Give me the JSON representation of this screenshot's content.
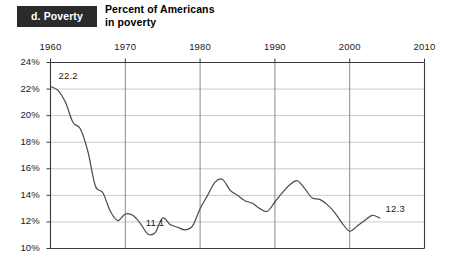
{
  "panel": {
    "tag_label": "d. Poverty"
  },
  "title": {
    "line1": "Percent of Americans",
    "line2": "in poverty"
  },
  "chart_data": {
    "type": "line",
    "title": "Percent of Americans in poverty",
    "xlabel": "",
    "ylabel": "",
    "xlim": [
      1960,
      2010
    ],
    "ylim": [
      10,
      24
    ],
    "xticks": [
      "1960",
      "1970",
      "1980",
      "1990",
      "2000",
      "2010"
    ],
    "xtick_values": [
      1960,
      1970,
      1980,
      1990,
      2000,
      2010
    ],
    "yticks": [
      "10%",
      "12%",
      "14%",
      "16%",
      "18%",
      "20%",
      "22%",
      "24%"
    ],
    "ytick_values": [
      10,
      12,
      14,
      16,
      18,
      20,
      22,
      24
    ],
    "grid": "both",
    "legend": "none",
    "series": [
      {
        "name": "Percent of Americans in poverty",
        "color": "#4a4a4a",
        "x": [
          1960,
          1961,
          1962,
          1963,
          1964,
          1965,
          1966,
          1967,
          1968,
          1969,
          1970,
          1971,
          1972,
          1973,
          1974,
          1975,
          1976,
          1977,
          1978,
          1979,
          1980,
          1981,
          1982,
          1983,
          1984,
          1985,
          1986,
          1987,
          1988,
          1989,
          1990,
          1991,
          1992,
          1993,
          1994,
          1995,
          1996,
          1997,
          1998,
          1999,
          2000,
          2001,
          2002,
          2003,
          2004
        ],
        "values": [
          22.2,
          21.9,
          21.0,
          19.5,
          19.0,
          17.3,
          14.7,
          14.2,
          12.8,
          12.1,
          12.6,
          12.5,
          11.9,
          11.1,
          11.2,
          12.3,
          11.8,
          11.6,
          11.4,
          11.7,
          13.0,
          14.0,
          15.0,
          15.2,
          14.4,
          14.0,
          13.6,
          13.4,
          13.0,
          12.8,
          13.5,
          14.2,
          14.8,
          15.1,
          14.5,
          13.8,
          13.7,
          13.3,
          12.7,
          11.9,
          11.3,
          11.7,
          12.1,
          12.5,
          12.3
        ]
      }
    ],
    "annotations": [
      {
        "label": "22.2",
        "x": 1960,
        "y": 22.2
      },
      {
        "label": "11.1",
        "x": 1973,
        "y": 11.1
      },
      {
        "label": "12.3",
        "x": 2004,
        "y": 12.3
      }
    ]
  },
  "colors": {
    "tag_background": "#2b2b2b",
    "tag_text": "#ffffff",
    "line": "#4a4a4a",
    "axis": "#3a3a3a",
    "vgrid": "#8a8a8a",
    "hgrid": "#c9c9c9",
    "text": "#1a1a1a",
    "background": "#ffffff"
  }
}
